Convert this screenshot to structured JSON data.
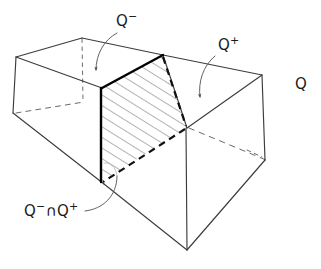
{
  "figure": {
    "kind": "hand-drawn-geometry-diagram",
    "background_color": "#ffffff",
    "line_color": "#3c3c3c",
    "bold_line_color": "#000000",
    "hatch_color": "#555555",
    "text_color": "#1a1a1a",
    "caption": ""
  },
  "labels": {
    "q_minus": {
      "base": "Q",
      "sup": "−"
    },
    "q_plus": {
      "base": "Q",
      "sup": "+"
    },
    "q": {
      "base": "Q",
      "sup": ""
    },
    "q_intersection": {
      "base": "Q",
      "sup": "−",
      "op": "∩",
      "base2": "Q",
      "sup2": "+"
    }
  },
  "geometry": {
    "box_vertices": {
      "top_back_left": [
        16,
        57
      ],
      "top_back_mid": [
        82,
        38
      ],
      "top_apex": [
        163,
        55
      ],
      "top_far_right": [
        262,
        75
      ],
      "front_left_bottom": [
        13,
        113
      ],
      "cut_top_left": [
        102,
        88
      ],
      "cut_bottom_left": [
        101,
        182
      ],
      "front_mid_vertical_top": [
        186,
        128
      ],
      "front_bottom_vertex": [
        187,
        250
      ],
      "right_lower": [
        265,
        160
      ],
      "hidden_back_lower": [
        240,
        135
      ]
    },
    "hatched_section": {
      "corners": [
        [
          102,
          88
        ],
        [
          163,
          55
        ],
        [
          186,
          128
        ],
        [
          101,
          182
        ]
      ],
      "hatch_angle_deg": 60,
      "hatch_spacing_px": 9
    }
  },
  "leaders": {
    "q_minus_arrow": {
      "from": [
        118,
        35
      ],
      "to": [
        96,
        72
      ],
      "style": "curved-arrow"
    },
    "q_plus_arrow": {
      "from": [
        216,
        57
      ],
      "to": [
        200,
        98
      ],
      "style": "curved-arrow"
    },
    "q_intersection_leader": {
      "from": [
        84,
        212
      ],
      "to": [
        117,
        175
      ],
      "style": "curved-line"
    }
  }
}
